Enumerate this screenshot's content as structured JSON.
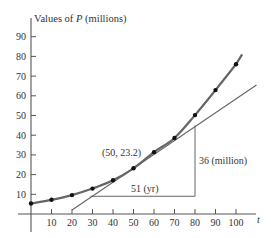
{
  "chart_data": {
    "type": "line",
    "title": "",
    "ylabel": "Values of P (millions)",
    "ylabel_prefix": "Values of ",
    "ylabel_var": "P",
    "ylabel_suffix": " (millions)",
    "xlabel": "t",
    "xlim": [
      0,
      110
    ],
    "ylim": [
      0,
      95
    ],
    "xticks": [
      10,
      20,
      30,
      40,
      50,
      60,
      70,
      80,
      90,
      100
    ],
    "yticks": [
      10,
      20,
      30,
      40,
      50,
      60,
      70,
      80,
      90
    ],
    "grid": false,
    "series": [
      {
        "name": "P (millions)",
        "x": [
          0,
          10,
          20,
          30,
          40,
          50,
          60,
          70,
          80,
          90,
          100
        ],
        "values": [
          5.3,
          7.2,
          9.6,
          12.9,
          17.1,
          23.2,
          31.4,
          38.6,
          50.2,
          62.9,
          76.0
        ]
      },
      {
        "name": "tangent at t=50",
        "x": [
          20,
          110
        ],
        "values": [
          2.0,
          65.5
        ]
      }
    ],
    "annotations": [
      {
        "text": "(50, 23.2)",
        "x": 50,
        "y": 23.2
      },
      {
        "text": "51 (yr)",
        "type": "run",
        "from": [
          29,
          9
        ],
        "to": [
          80,
          9
        ]
      },
      {
        "text": "36 (million)",
        "type": "rise",
        "from": [
          80,
          9
        ],
        "to": [
          80,
          45
        ]
      }
    ]
  }
}
